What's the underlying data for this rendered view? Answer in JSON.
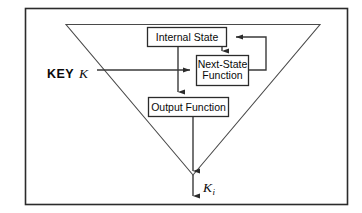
{
  "diagram": {
    "background_color": "#ffffff",
    "line_color": "#3a3a3a",
    "frame_color": "#2b2b2b",
    "text_color": "#0a0a0a",
    "frame": {
      "x": 25,
      "y": 8,
      "width": 323,
      "height": 197
    },
    "funnel": {
      "name": "inverted-triangle",
      "top_left": {
        "x": 66,
        "y": 24
      },
      "top_right": {
        "x": 320,
        "y": 24
      },
      "apex": {
        "x": 193,
        "y": 175
      }
    },
    "boxes": [
      {
        "id": "internal-state",
        "label": "Internal State",
        "lines": [
          "Internal State"
        ],
        "x": 147,
        "y": 27,
        "width": 80,
        "height": 20
      },
      {
        "id": "next-state-function",
        "label": "Next-State Function",
        "lines": [
          "Next-State",
          "Function"
        ],
        "x": 196,
        "y": 55,
        "width": 53,
        "height": 31
      },
      {
        "id": "output-function",
        "label": "Output Function",
        "lines": [
          "Output Function"
        ],
        "x": 148,
        "y": 97,
        "width": 81,
        "height": 20
      }
    ],
    "labels": [
      {
        "id": "key-input",
        "text_main": "KEY",
        "text_italic": "K",
        "x": 47,
        "y": 74
      },
      {
        "id": "keystream-output",
        "text_main": "K",
        "subscript": "i",
        "x": 203,
        "y": 190
      }
    ],
    "connectors": [
      {
        "id": "key-to-next-state",
        "from": "KEY K",
        "to": "Next-State Function",
        "arrow": true
      },
      {
        "id": "internal-state-to-next-state",
        "from": "Internal State",
        "to": "Next-State Function",
        "arrow": true
      },
      {
        "id": "next-state-feedback-to-internal-state",
        "from": "Next-State Function",
        "to": "Internal State",
        "arrow": true
      },
      {
        "id": "internal-state-to-output-function",
        "from": "Internal State",
        "to": "Output Function",
        "arrow": true
      },
      {
        "id": "output-function-to-keystream",
        "from": "Output Function",
        "to": "K i",
        "arrow": true
      }
    ]
  }
}
